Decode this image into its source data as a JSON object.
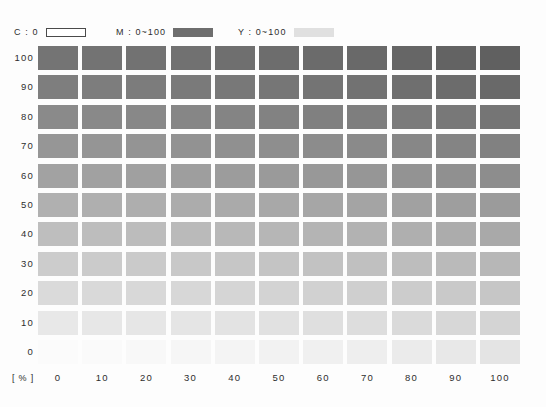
{
  "legend": {
    "entries": [
      {
        "name": "cyan",
        "label": "C : 0",
        "swatch_style": "outline",
        "color": "#ffffff"
      },
      {
        "name": "magenta",
        "label": "M : 0~100",
        "swatch_style": "solid",
        "color": "#6e6e6e"
      },
      {
        "name": "yellow",
        "label": "Y : 0~100",
        "swatch_style": "solid",
        "color": "#e0e0e0"
      }
    ]
  },
  "axes": {
    "unit_label": "[ % ]",
    "y_label_name": "magenta-percent",
    "x_label_name": "yellow-percent",
    "y_ticks": [
      "100",
      "90",
      "80",
      "70",
      "60",
      "50",
      "40",
      "30",
      "20",
      "10",
      "0"
    ],
    "x_ticks": [
      "0",
      "10",
      "20",
      "30",
      "40",
      "50",
      "60",
      "70",
      "80",
      "90",
      "100"
    ]
  },
  "chart_data": {
    "type": "heatmap",
    "title": "",
    "xlabel": "Y : 0~100 [ % ]",
    "ylabel": "M : 0~100 [ % ]",
    "constant": {
      "C": 0
    },
    "x": [
      0,
      10,
      20,
      30,
      40,
      50,
      60,
      70,
      80,
      90,
      100
    ],
    "y": [
      100,
      90,
      80,
      70,
      60,
      50,
      40,
      30,
      20,
      10,
      0
    ],
    "grid": false,
    "legend_position": "top",
    "colors": [
      [
        "#747474",
        "#737373",
        "#727272",
        "#717171",
        "#6f6f6f",
        "#6d6d6d",
        "#6b6b6b",
        "#696969",
        "#666666",
        "#636363",
        "#606060"
      ],
      [
        "#7e7e7e",
        "#7d7d7d",
        "#7c7c7c",
        "#7a7a7a",
        "#787878",
        "#767676",
        "#747474",
        "#727272",
        "#6f6f6f",
        "#6c6c6c",
        "#696969"
      ],
      [
        "#8a8a8a",
        "#898989",
        "#888888",
        "#868686",
        "#848484",
        "#828282",
        "#808080",
        "#7e7e7e",
        "#7b7b7b",
        "#787878",
        "#757575"
      ],
      [
        "#969696",
        "#959595",
        "#949494",
        "#929292",
        "#909090",
        "#8e8e8e",
        "#8c8c8c",
        "#8a8a8a",
        "#878787",
        "#848484",
        "#818181"
      ],
      [
        "#a2a2a2",
        "#a1a1a1",
        "#a0a0a0",
        "#9e9e9e",
        "#9c9c9c",
        "#9a9a9a",
        "#989898",
        "#969696",
        "#939393",
        "#909090",
        "#8d8d8d"
      ],
      [
        "#b0b0b0",
        "#afafaf",
        "#aeaeae",
        "#acacac",
        "#aaaaaa",
        "#a8a8a8",
        "#a6a6a6",
        "#a4a4a4",
        "#a1a1a1",
        "#9e9e9e",
        "#9b9b9b"
      ],
      [
        "#bebebe",
        "#bdbdbd",
        "#bcbcbc",
        "#bababa",
        "#b8b8b8",
        "#b6b6b6",
        "#b4b4b4",
        "#b2b2b2",
        "#afafaf",
        "#acacac",
        "#a9a9a9"
      ],
      [
        "#cccccc",
        "#cbcbcb",
        "#cacaca",
        "#c8c8c8",
        "#c6c6c6",
        "#c4c4c4",
        "#c2c2c2",
        "#c0c0c0",
        "#bdbdbd",
        "#bababa",
        "#b7b7b7"
      ],
      [
        "#dadada",
        "#d9d9d9",
        "#d8d8d8",
        "#d7d7d7",
        "#d5d5d5",
        "#d3d3d3",
        "#d1d1d1",
        "#cfcfcf",
        "#cccccc",
        "#c9c9c9",
        "#c6c6c6"
      ],
      [
        "#e8e8e8",
        "#e7e7e7",
        "#e6e6e6",
        "#e5e5e5",
        "#e3e3e3",
        "#e1e1e1",
        "#dfdfdf",
        "#dddddd",
        "#dadada",
        "#d7d7d7",
        "#d4d4d4"
      ],
      [
        "#fbfbfb",
        "#fafafa",
        "#f8f8f8",
        "#f6f6f6",
        "#f4f4f4",
        "#f2f2f2",
        "#f0f0f0",
        "#eeeeee",
        "#ebebeb",
        "#e8e8e8",
        "#e4e4e4"
      ]
    ]
  }
}
